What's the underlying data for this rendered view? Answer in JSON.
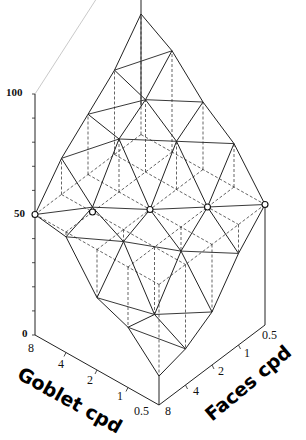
{
  "chart_data": {
    "type": "surface3d",
    "title": "",
    "x_axis": {
      "label": "Goblet cpd",
      "ticks": [
        "8",
        "4",
        "2",
        "1",
        "0.5"
      ]
    },
    "y_axis": {
      "label": "Faces cpd",
      "ticks": [
        "0.5",
        "1",
        "2",
        "4",
        "8"
      ]
    },
    "z_axis": {
      "label": "",
      "ticks": [
        "0",
        "50",
        "100"
      ],
      "range": [
        0,
        100
      ]
    },
    "reference_plane": 50,
    "goblet_cpd": [
      8,
      4,
      2,
      1,
      0.5
    ],
    "faces_cpd": [
      0.5,
      1,
      2,
      4,
      8
    ],
    "z_values_rows_goblet_cols_faces": [
      [
        100,
        85,
        75,
        65,
        50
      ],
      [
        92,
        80,
        72,
        52,
        48
      ],
      [
        78,
        70,
        50,
        45,
        30
      ],
      [
        68,
        50,
        40,
        22,
        25
      ],
      [
        50,
        38,
        22,
        15,
        12
      ]
    ],
    "markers_at_50": [
      [
        0,
        4
      ],
      [
        1,
        3
      ],
      [
        2,
        2
      ],
      [
        3,
        1
      ],
      [
        4,
        0
      ]
    ]
  },
  "labels": {
    "z100": "100",
    "z50": "50",
    "z0": "0",
    "goblet_axis": "Goblet cpd",
    "faces_axis": "Faces cpd",
    "goblet_ticks": [
      "8",
      "4",
      "2",
      "1",
      "0.5"
    ],
    "faces_ticks": [
      "0.5",
      "1",
      "2",
      "4",
      "8"
    ]
  }
}
